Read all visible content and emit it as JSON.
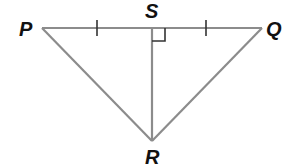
{
  "diagram": {
    "type": "geometry-triangle",
    "colors": {
      "line": "#8c8c8c",
      "mark": "#333333",
      "label": "#111111",
      "background": "#ffffff"
    },
    "points": {
      "P": {
        "label": "P",
        "x": 42,
        "y": 28
      },
      "Q": {
        "label": "Q",
        "x": 262,
        "y": 28
      },
      "S": {
        "label": "S",
        "x": 152,
        "y": 28
      },
      "R": {
        "label": "R",
        "x": 152,
        "y": 141
      }
    },
    "segments": [
      "PQ",
      "PR",
      "QR",
      "SR"
    ],
    "marks": {
      "congruent_ticks": [
        "PS",
        "SQ"
      ],
      "right_angle_at": "S"
    }
  }
}
